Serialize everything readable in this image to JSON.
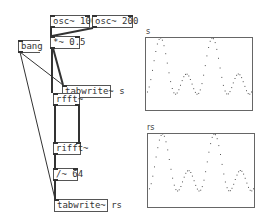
{
  "objects": {
    "osc1": "osc~ 100",
    "osc2": "osc~ 200",
    "mult": "*~ 0.5",
    "bang": "bang",
    "tabwrite_s": "tabwrite~ s",
    "rfft": "rfft~",
    "rifft": "rifft~",
    "div": "/~ 64",
    "tabwrite_rs": "tabwrite~ rs"
  },
  "graphs": [
    {
      "label": "s",
      "cycles_f1": 2,
      "cycles_f2": 4,
      "gain": 0.5,
      "ylim": [
        -1,
        1
      ]
    },
    {
      "label": "rs",
      "cycles_f1": 2,
      "cycles_f2": 4,
      "gain": 0.5,
      "ylim": [
        -1,
        1
      ]
    }
  ]
}
